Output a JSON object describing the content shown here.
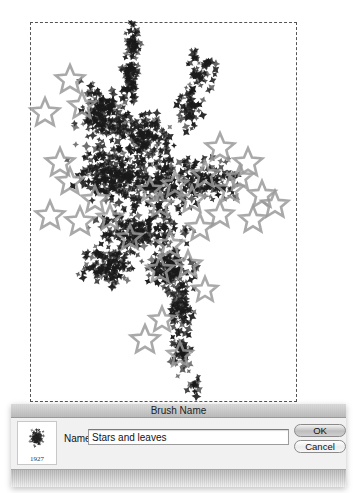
{
  "canvas": {
    "artboard": {
      "x": 30,
      "y": 22,
      "w": 267,
      "h": 380
    },
    "leaf_color": "#1a1a1a",
    "star_color": "#9a9a9a",
    "leaf_clusters": [
      {
        "cx": 133,
        "cy": 40,
        "rx": 8,
        "ry": 18,
        "n": 45
      },
      {
        "cx": 130,
        "cy": 80,
        "rx": 10,
        "ry": 25,
        "n": 70
      },
      {
        "cx": 200,
        "cy": 70,
        "rx": 16,
        "ry": 22,
        "n": 55
      },
      {
        "cx": 190,
        "cy": 110,
        "rx": 14,
        "ry": 22,
        "n": 55
      },
      {
        "cx": 105,
        "cy": 115,
        "rx": 28,
        "ry": 30,
        "n": 170
      },
      {
        "cx": 145,
        "cy": 135,
        "rx": 30,
        "ry": 25,
        "n": 140
      },
      {
        "cx": 110,
        "cy": 175,
        "rx": 38,
        "ry": 30,
        "n": 220
      },
      {
        "cx": 160,
        "cy": 185,
        "rx": 42,
        "ry": 30,
        "n": 200
      },
      {
        "cx": 210,
        "cy": 180,
        "rx": 32,
        "ry": 22,
        "n": 110
      },
      {
        "cx": 140,
        "cy": 230,
        "rx": 45,
        "ry": 25,
        "n": 200
      },
      {
        "cx": 110,
        "cy": 265,
        "rx": 30,
        "ry": 20,
        "n": 130
      },
      {
        "cx": 170,
        "cy": 270,
        "rx": 26,
        "ry": 22,
        "n": 120
      },
      {
        "cx": 180,
        "cy": 310,
        "rx": 14,
        "ry": 25,
        "n": 80
      },
      {
        "cx": 182,
        "cy": 355,
        "rx": 12,
        "ry": 22,
        "n": 50
      },
      {
        "cx": 195,
        "cy": 385,
        "rx": 8,
        "ry": 10,
        "n": 15
      }
    ],
    "stars": [
      [
        70,
        80,
        15
      ],
      [
        45,
        113,
        15
      ],
      [
        82,
        106,
        14
      ],
      [
        60,
        163,
        15
      ],
      [
        70,
        182,
        14
      ],
      [
        50,
        216,
        15
      ],
      [
        80,
        222,
        15
      ],
      [
        95,
        200,
        14
      ],
      [
        110,
        218,
        13
      ],
      [
        220,
        148,
        15
      ],
      [
        248,
        163,
        15
      ],
      [
        230,
        190,
        14
      ],
      [
        262,
        195,
        14
      ],
      [
        275,
        205,
        14
      ],
      [
        253,
        220,
        14
      ],
      [
        205,
        175,
        14
      ],
      [
        192,
        200,
        14
      ],
      [
        175,
        185,
        13
      ],
      [
        160,
        205,
        13
      ],
      [
        200,
        228,
        14
      ],
      [
        220,
        215,
        14
      ],
      [
        170,
        245,
        14
      ],
      [
        160,
        270,
        14
      ],
      [
        188,
        265,
        14
      ],
      [
        205,
        290,
        13
      ],
      [
        145,
        340,
        15
      ],
      [
        162,
        320,
        13
      ],
      [
        180,
        355,
        13
      ],
      [
        130,
        238,
        13
      ],
      [
        240,
        178,
        13
      ],
      [
        150,
        190,
        12
      ]
    ]
  },
  "dialog": {
    "title": "Brush Name",
    "thumbnail_number": "1927",
    "name_label": "Name:",
    "name_value": "Stars and leaves",
    "ok_label": "OK",
    "cancel_label": "Cancel"
  }
}
